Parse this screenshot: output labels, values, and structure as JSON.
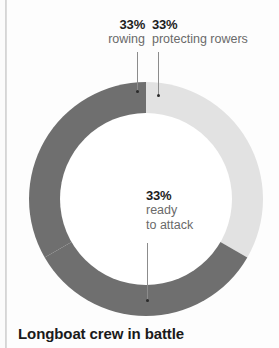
{
  "title": "Longboat crew in battle",
  "callouts": {
    "rowing": {
      "pct": "33%",
      "desc": "rowing"
    },
    "protecting": {
      "pct": "33%",
      "desc": "protecting rowers"
    },
    "ready": {
      "pct": "33%",
      "desc_line1": "ready",
      "desc_line2": "to attack"
    }
  },
  "colors": {
    "dark_segment": "#6f6f6f",
    "light_segment": "#e2e2e2",
    "hole": "#ffffff",
    "label_text": "#6a6a6a",
    "pct_text": "#1d1d1d",
    "title_text": "#1a1a1a",
    "leader_line": "#8c8c8c"
  },
  "chart_data": {
    "type": "pie",
    "variant": "donut",
    "title": "Longboat crew in battle",
    "xlabel": "",
    "ylabel": "",
    "legend_position": "callouts",
    "grid": false,
    "hole_ratio": 0.735,
    "start_angle_deg": 0,
    "direction": "clockwise",
    "units": "percent",
    "labels": [
      "rowing",
      "protecting rowers",
      "ready to attack"
    ],
    "values": [
      33,
      33,
      33
    ],
    "value_labels": [
      "33%",
      "33%",
      "33%"
    ],
    "slice_colors": [
      "#6f6f6f",
      "#e2e2e2",
      "#6f6f6f"
    ],
    "slices": [
      {
        "label": "rowing",
        "value": 33,
        "value_label": "33%",
        "color": "#6f6f6f",
        "start_deg": 240,
        "end_deg": 360
      },
      {
        "label": "protecting rowers",
        "value": 33,
        "value_label": "33%",
        "color": "#e2e2e2",
        "start_deg": 0,
        "end_deg": 120
      },
      {
        "label": "ready to attack",
        "value": 33,
        "value_label": "33%",
        "color": "#6f6f6f",
        "start_deg": 120,
        "end_deg": 240
      }
    ]
  }
}
